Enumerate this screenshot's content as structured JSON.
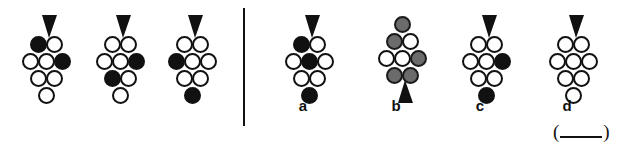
{
  "figure": {
    "kind": "non-verbal-reasoning-item",
    "colors": {
      "outline": "#111111",
      "filled": "#111111",
      "gray": "#6b6b6b",
      "background": "#ffffff"
    },
    "divider": {
      "name": "vertical-divider"
    },
    "answer_blank": {
      "open_paren": "(",
      "blank": "",
      "close_paren": ")"
    }
  },
  "stem": {
    "label": "stem-sequence",
    "items": [
      {
        "id": "stem-1",
        "arrow": {
          "direction": "down",
          "position": "top"
        },
        "rows": [
          [
            "filled",
            "white"
          ],
          [
            "white",
            "white",
            "filled"
          ],
          [
            "white",
            "white"
          ],
          [
            "white"
          ]
        ]
      },
      {
        "id": "stem-2",
        "arrow": {
          "direction": "down",
          "position": "top"
        },
        "rows": [
          [
            "white",
            "white"
          ],
          [
            "white",
            "white",
            "filled"
          ],
          [
            "filled",
            "white"
          ],
          [
            "white"
          ]
        ]
      },
      {
        "id": "stem-3",
        "arrow": {
          "direction": "down",
          "position": "top"
        },
        "rows": [
          [
            "white",
            "white"
          ],
          [
            "filled",
            "white",
            "white"
          ],
          [
            "white",
            "white"
          ],
          [
            "filled"
          ]
        ]
      }
    ]
  },
  "options": {
    "label": "answer-options",
    "items": [
      {
        "id": "option-a",
        "letter": "a",
        "arrow": {
          "direction": "down",
          "position": "top"
        },
        "orientation": "upright",
        "rows": [
          [
            "filled",
            "white"
          ],
          [
            "white",
            "filled",
            "white"
          ],
          [
            "white",
            "white"
          ],
          [
            "filled"
          ]
        ]
      },
      {
        "id": "option-b",
        "letter": "b",
        "arrow": {
          "direction": "down",
          "position": "bottom"
        },
        "orientation": "inverted",
        "rows": [
          [
            "gray"
          ],
          [
            "gray",
            "white"
          ],
          [
            "white",
            "white",
            "gray"
          ],
          [
            "gray",
            "gray"
          ]
        ]
      },
      {
        "id": "option-c",
        "letter": "c",
        "arrow": {
          "direction": "down",
          "position": "top"
        },
        "orientation": "upright",
        "rows": [
          [
            "white",
            "white"
          ],
          [
            "white",
            "white",
            "filled"
          ],
          [
            "white",
            "white"
          ],
          [
            "filled"
          ]
        ]
      },
      {
        "id": "option-d",
        "letter": "d",
        "arrow": {
          "direction": "down",
          "position": "top"
        },
        "orientation": "upright",
        "rows": [
          [
            "white",
            "white"
          ],
          [
            "white",
            "white",
            "white"
          ],
          [
            "white",
            "white"
          ],
          [
            "white"
          ]
        ]
      }
    ]
  }
}
